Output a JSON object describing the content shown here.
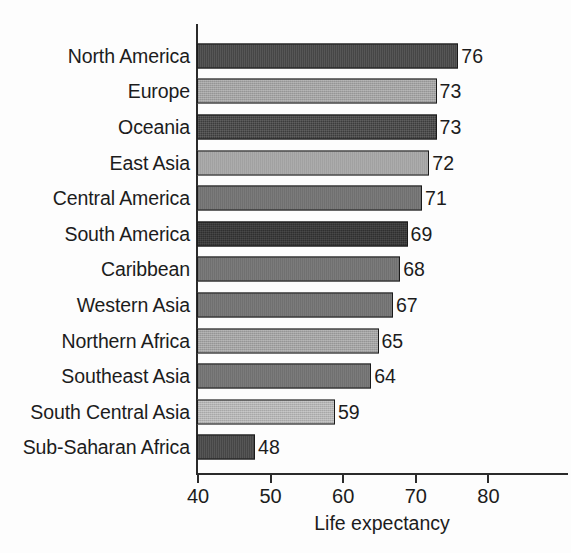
{
  "chart_data": {
    "type": "bar",
    "orientation": "horizontal",
    "title": "",
    "xlabel": "Life expectancy",
    "ylabel": "",
    "xlim": [
      40,
      81
    ],
    "xticks": [
      40,
      50,
      60,
      70,
      80
    ],
    "xtick_labels": [
      "40",
      "50",
      "60",
      "70",
      "80"
    ],
    "grid": false,
    "legend": null,
    "categories": [
      "North America",
      "Europe",
      "Oceania",
      "East Asia",
      "Central America",
      "South America",
      "Caribbean",
      "Western Asia",
      "Northern Africa",
      "Southeast Asia",
      "South Central Asia",
      "Sub-Saharan Africa"
    ],
    "values": [
      76,
      73,
      73,
      72,
      71,
      69,
      68,
      67,
      65,
      64,
      59,
      48
    ],
    "value_labels": [
      "76",
      "73",
      "73",
      "72",
      "71",
      "69",
      "68",
      "67",
      "65",
      "64",
      "59",
      "48"
    ],
    "bar_tones": [
      "tone-dark",
      "tone-light",
      "tone-dark",
      "tone-light",
      "tone-mid",
      "tone-darker",
      "tone-mid",
      "tone-mid",
      "tone-light",
      "tone-mid",
      "tone-lighter",
      "tone-dark"
    ],
    "colors": {
      "tone-darker": "#2f2f2f",
      "tone-dark": "#3c3c3c",
      "tone-mid": "#6f6f6f",
      "tone-light": "#a2a2a2",
      "tone-lighter": "#b4b4b4",
      "axis": "#2b2b2b",
      "text": "#1c1c1c",
      "background": "#fdfdfd"
    }
  }
}
